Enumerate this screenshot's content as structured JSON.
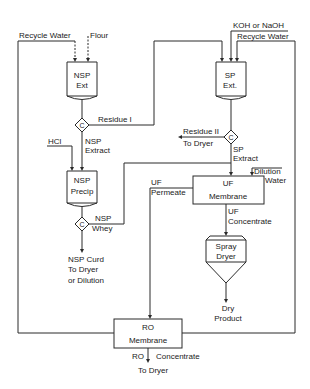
{
  "diagram": {
    "type": "process-flow",
    "inputs": {
      "recycle_water_left": "Recycle Water",
      "flour": "Flour",
      "koh_naoh": "KOH or NaOH",
      "recycle_water_right": "Recycle Water",
      "hcl": "HCl",
      "dilution_1": "Dilution",
      "dilution_2": "Water"
    },
    "units": {
      "nsp_ext": {
        "line1": "NSP",
        "line2": "Ext"
      },
      "sp_ext": {
        "line1": "SP",
        "line2": "Ext."
      },
      "nsp_precip": {
        "line1": "NSP",
        "line2": "Precip"
      },
      "uf_membrane": {
        "line1": "UF",
        "line2": "Membrane"
      },
      "spray_dryer": {
        "line1": "Spray",
        "line2": "Dryer"
      },
      "ro_membrane": {
        "line1": "RO",
        "line2": "Membrane"
      }
    },
    "separators": {
      "c1": "C",
      "c2": "C",
      "c3": "C"
    },
    "streams": {
      "residue_1": "Residue I",
      "nsp_extract_1": "NSP",
      "nsp_extract_2": "Extract",
      "residue_2": "Residue II",
      "residue_2_dest": "To Dryer",
      "sp_extract_1": "SP",
      "sp_extract_2": "Extract",
      "nsp_whey_1": "NSP",
      "nsp_whey_2": "Whey",
      "nsp_curd_1": "NSP Curd",
      "nsp_curd_2": "To Dryer",
      "nsp_curd_3": "or Dilution",
      "uf_permeate_1": "UF",
      "uf_permeate_2": "Permeate",
      "uf_concentrate_1": "UF",
      "uf_concentrate_2": "Concentrate",
      "dry_product_1": "Dry",
      "dry_product_2": "Product",
      "ro_concentrate_1": "RO",
      "ro_concentrate_2": "Concentrate",
      "ro_concentrate_dest": "To Dryer"
    }
  }
}
